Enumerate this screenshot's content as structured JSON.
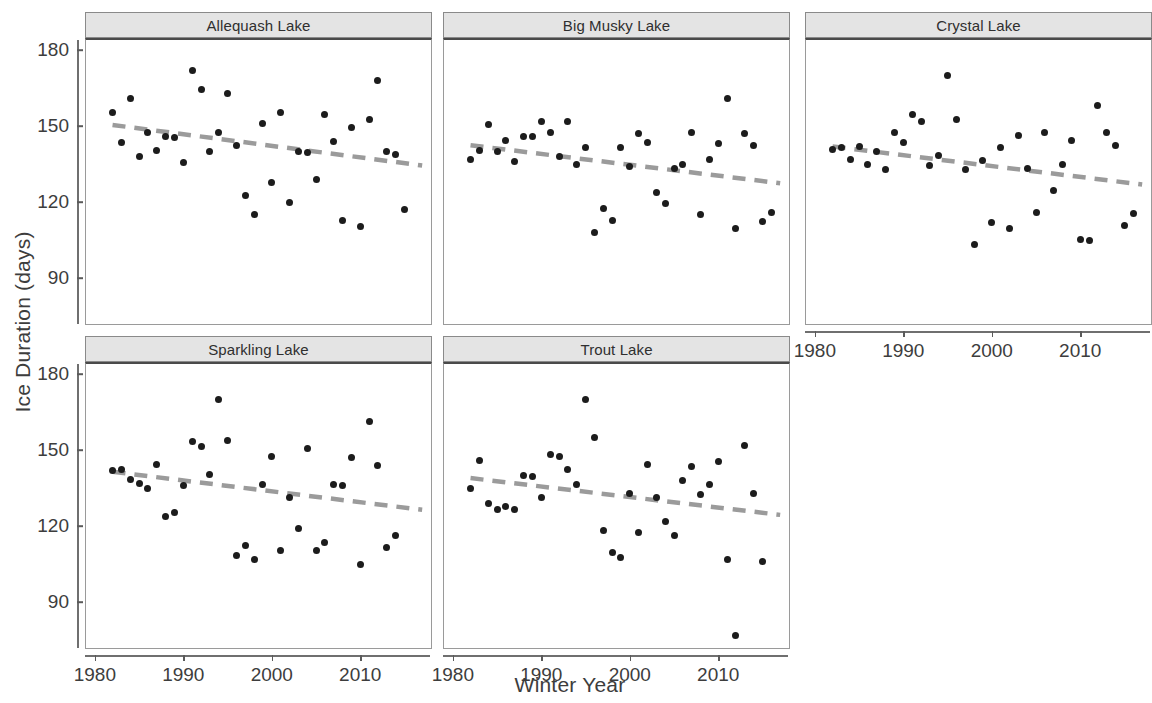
{
  "chart_data": {
    "type": "scatter",
    "title": "",
    "xlabel": "Winter Year",
    "ylabel": "Ice Duration (days)",
    "xlim": [
      1979,
      2018
    ],
    "ylim": [
      72,
      184
    ],
    "xticks": [
      1980,
      1990,
      2000,
      2010
    ],
    "yticks": [
      90,
      120,
      150,
      180
    ],
    "grid": false,
    "legend": null,
    "facet_layout": {
      "rows": 2,
      "cols": 3,
      "empty_cells": [
        [
          1,
          2
        ]
      ]
    },
    "point_color": "#1c1c1c",
    "trend_color": "#9b9b9b",
    "strip_fill": "#e4e4e4",
    "panels": [
      {
        "name": "Allequash Lake",
        "row": 0,
        "col": 0,
        "x_axis_visible": false,
        "y_axis_visible": true,
        "trend": {
          "type": "linear-dashed",
          "x": [
            1982,
            2017
          ],
          "y": [
            150.5,
            134.5
          ]
        },
        "points": [
          {
            "x": 1982,
            "y": 155.5
          },
          {
            "x": 1983,
            "y": 143.5
          },
          {
            "x": 1984,
            "y": 161.0
          },
          {
            "x": 1985,
            "y": 138.0
          },
          {
            "x": 1986,
            "y": 147.5
          },
          {
            "x": 1987,
            "y": 140.5
          },
          {
            "x": 1988,
            "y": 146.0
          },
          {
            "x": 1989,
            "y": 145.5
          },
          {
            "x": 1990,
            "y": 135.5
          },
          {
            "x": 1991,
            "y": 172.0
          },
          {
            "x": 1992,
            "y": 164.5
          },
          {
            "x": 1993,
            "y": 140.0
          },
          {
            "x": 1994,
            "y": 147.5
          },
          {
            "x": 1995,
            "y": 163.0
          },
          {
            "x": 1996,
            "y": 142.5
          },
          {
            "x": 1997,
            "y": 122.5
          },
          {
            "x": 1998,
            "y": 115.0
          },
          {
            "x": 1999,
            "y": 151.0
          },
          {
            "x": 2000,
            "y": 128.0
          },
          {
            "x": 2001,
            "y": 155.5
          },
          {
            "x": 2002,
            "y": 120.0
          },
          {
            "x": 2003,
            "y": 140.0
          },
          {
            "x": 2004,
            "y": 139.5
          },
          {
            "x": 2005,
            "y": 129.0
          },
          {
            "x": 2006,
            "y": 154.5
          },
          {
            "x": 2007,
            "y": 144.0
          },
          {
            "x": 2008,
            "y": 113.0
          },
          {
            "x": 2009,
            "y": 149.5
          },
          {
            "x": 2010,
            "y": 110.5
          },
          {
            "x": 2011,
            "y": 152.5
          },
          {
            "x": 2012,
            "y": 168.0
          },
          {
            "x": 2013,
            "y": 140.0
          },
          {
            "x": 2014,
            "y": 139.0
          },
          {
            "x": 2015,
            "y": 117.0
          }
        ]
      },
      {
        "name": "Big Musky Lake",
        "row": 0,
        "col": 1,
        "x_axis_visible": false,
        "y_axis_visible": false,
        "trend": {
          "type": "linear-dashed",
          "x": [
            1982,
            2017
          ],
          "y": [
            142.5,
            127.5
          ]
        },
        "points": [
          {
            "x": 1982,
            "y": 137.0
          },
          {
            "x": 1983,
            "y": 140.5
          },
          {
            "x": 1984,
            "y": 150.5
          },
          {
            "x": 1985,
            "y": 140.0
          },
          {
            "x": 1986,
            "y": 144.5
          },
          {
            "x": 1987,
            "y": 136.0
          },
          {
            "x": 1988,
            "y": 146.0
          },
          {
            "x": 1989,
            "y": 146.0
          },
          {
            "x": 1990,
            "y": 152.0
          },
          {
            "x": 1991,
            "y": 147.5
          },
          {
            "x": 1992,
            "y": 138.0
          },
          {
            "x": 1993,
            "y": 152.0
          },
          {
            "x": 1994,
            "y": 135.0
          },
          {
            "x": 1995,
            "y": 141.5
          },
          {
            "x": 1996,
            "y": 108.0
          },
          {
            "x": 1997,
            "y": 117.5
          },
          {
            "x": 1998,
            "y": 113.0
          },
          {
            "x": 1999,
            "y": 141.5
          },
          {
            "x": 2000,
            "y": 134.0
          },
          {
            "x": 2001,
            "y": 147.0
          },
          {
            "x": 2002,
            "y": 143.5
          },
          {
            "x": 2003,
            "y": 124.0
          },
          {
            "x": 2004,
            "y": 119.5
          },
          {
            "x": 2005,
            "y": 133.5
          },
          {
            "x": 2006,
            "y": 135.0
          },
          {
            "x": 2007,
            "y": 147.5
          },
          {
            "x": 2008,
            "y": 115.0
          },
          {
            "x": 2009,
            "y": 137.0
          },
          {
            "x": 2010,
            "y": 143.0
          },
          {
            "x": 2011,
            "y": 161.0
          },
          {
            "x": 2012,
            "y": 109.5
          },
          {
            "x": 2013,
            "y": 147.0
          },
          {
            "x": 2014,
            "y": 142.5
          },
          {
            "x": 2015,
            "y": 112.5
          },
          {
            "x": 2016,
            "y": 116.0
          }
        ]
      },
      {
        "name": "Crystal Lake",
        "row": 0,
        "col": 2,
        "x_axis_visible": true,
        "y_axis_visible": false,
        "trend": {
          "type": "linear-dashed",
          "x": [
            1982,
            2017
          ],
          "y": [
            142.0,
            127.0
          ]
        },
        "points": [
          {
            "x": 1982,
            "y": 141.0
          },
          {
            "x": 1983,
            "y": 141.5
          },
          {
            "x": 1984,
            "y": 137.0
          },
          {
            "x": 1985,
            "y": 142.0
          },
          {
            "x": 1986,
            "y": 135.0
          },
          {
            "x": 1987,
            "y": 140.0
          },
          {
            "x": 1988,
            "y": 133.0
          },
          {
            "x": 1989,
            "y": 147.5
          },
          {
            "x": 1990,
            "y": 143.5
          },
          {
            "x": 1991,
            "y": 154.5
          },
          {
            "x": 1992,
            "y": 152.0
          },
          {
            "x": 1993,
            "y": 134.5
          },
          {
            "x": 1994,
            "y": 138.5
          },
          {
            "x": 1995,
            "y": 170.0
          },
          {
            "x": 1996,
            "y": 152.5
          },
          {
            "x": 1997,
            "y": 133.0
          },
          {
            "x": 1998,
            "y": 103.5
          },
          {
            "x": 1999,
            "y": 136.5
          },
          {
            "x": 2000,
            "y": 112.0
          },
          {
            "x": 2001,
            "y": 141.5
          },
          {
            "x": 2002,
            "y": 109.5
          },
          {
            "x": 2003,
            "y": 146.5
          },
          {
            "x": 2004,
            "y": 133.5
          },
          {
            "x": 2005,
            "y": 116.0
          },
          {
            "x": 2006,
            "y": 147.5
          },
          {
            "x": 2007,
            "y": 124.5
          },
          {
            "x": 2008,
            "y": 135.0
          },
          {
            "x": 2009,
            "y": 144.5
          },
          {
            "x": 2010,
            "y": 105.5
          },
          {
            "x": 2011,
            "y": 105.0
          },
          {
            "x": 2012,
            "y": 158.0
          },
          {
            "x": 2013,
            "y": 147.5
          },
          {
            "x": 2014,
            "y": 142.5
          },
          {
            "x": 2015,
            "y": 111.0
          },
          {
            "x": 2016,
            "y": 115.5
          }
        ]
      },
      {
        "name": "Sparkling Lake",
        "row": 1,
        "col": 0,
        "x_axis_visible": true,
        "y_axis_visible": true,
        "trend": {
          "type": "linear-dashed",
          "x": [
            1982,
            2017
          ],
          "y": [
            141.5,
            126.5
          ]
        },
        "points": [
          {
            "x": 1982,
            "y": 142.0
          },
          {
            "x": 1983,
            "y": 142.5
          },
          {
            "x": 1984,
            "y": 138.5
          },
          {
            "x": 1985,
            "y": 137.0
          },
          {
            "x": 1986,
            "y": 135.0
          },
          {
            "x": 1987,
            "y": 144.5
          },
          {
            "x": 1988,
            "y": 124.0
          },
          {
            "x": 1989,
            "y": 125.5
          },
          {
            "x": 1990,
            "y": 136.0
          },
          {
            "x": 1991,
            "y": 153.5
          },
          {
            "x": 1992,
            "y": 151.5
          },
          {
            "x": 1993,
            "y": 140.5
          },
          {
            "x": 1994,
            "y": 170.0
          },
          {
            "x": 1995,
            "y": 154.0
          },
          {
            "x": 1996,
            "y": 108.5
          },
          {
            "x": 1997,
            "y": 112.5
          },
          {
            "x": 1998,
            "y": 107.0
          },
          {
            "x": 1999,
            "y": 136.5
          },
          {
            "x": 2000,
            "y": 147.5
          },
          {
            "x": 2001,
            "y": 110.5
          },
          {
            "x": 2002,
            "y": 131.5
          },
          {
            "x": 2003,
            "y": 119.0
          },
          {
            "x": 2004,
            "y": 150.5
          },
          {
            "x": 2005,
            "y": 110.5
          },
          {
            "x": 2006,
            "y": 113.5
          },
          {
            "x": 2007,
            "y": 136.5
          },
          {
            "x": 2008,
            "y": 136.0
          },
          {
            "x": 2009,
            "y": 147.0
          },
          {
            "x": 2010,
            "y": 105.0
          },
          {
            "x": 2011,
            "y": 161.5
          },
          {
            "x": 2012,
            "y": 144.0
          },
          {
            "x": 2013,
            "y": 111.5
          },
          {
            "x": 2014,
            "y": 116.5
          }
        ]
      },
      {
        "name": "Trout Lake",
        "row": 1,
        "col": 1,
        "x_axis_visible": true,
        "y_axis_visible": false,
        "trend": {
          "type": "linear-dashed",
          "x": [
            1982,
            2017
          ],
          "y": [
            139.0,
            124.5
          ]
        },
        "points": [
          {
            "x": 1982,
            "y": 135.0
          },
          {
            "x": 1983,
            "y": 146.0
          },
          {
            "x": 1984,
            "y": 129.0
          },
          {
            "x": 1985,
            "y": 126.5
          },
          {
            "x": 1986,
            "y": 128.0
          },
          {
            "x": 1987,
            "y": 126.5
          },
          {
            "x": 1988,
            "y": 140.0
          },
          {
            "x": 1989,
            "y": 139.5
          },
          {
            "x": 1990,
            "y": 131.5
          },
          {
            "x": 1991,
            "y": 148.5
          },
          {
            "x": 1992,
            "y": 147.5
          },
          {
            "x": 1993,
            "y": 142.5
          },
          {
            "x": 1994,
            "y": 136.5
          },
          {
            "x": 1995,
            "y": 170.0
          },
          {
            "x": 1996,
            "y": 155.0
          },
          {
            "x": 1997,
            "y": 118.5
          },
          {
            "x": 1998,
            "y": 109.5
          },
          {
            "x": 1999,
            "y": 107.5
          },
          {
            "x": 2000,
            "y": 133.0
          },
          {
            "x": 2001,
            "y": 117.5
          },
          {
            "x": 2002,
            "y": 144.5
          },
          {
            "x": 2003,
            "y": 131.5
          },
          {
            "x": 2004,
            "y": 122.0
          },
          {
            "x": 2005,
            "y": 116.5
          },
          {
            "x": 2006,
            "y": 138.0
          },
          {
            "x": 2007,
            "y": 143.5
          },
          {
            "x": 2008,
            "y": 132.5
          },
          {
            "x": 2009,
            "y": 136.5
          },
          {
            "x": 2010,
            "y": 145.5
          },
          {
            "x": 2011,
            "y": 107.0
          },
          {
            "x": 2012,
            "y": 77.0
          },
          {
            "x": 2013,
            "y": 152.0
          },
          {
            "x": 2014,
            "y": 133.0
          },
          {
            "x": 2015,
            "y": 106.0
          }
        ]
      }
    ]
  }
}
